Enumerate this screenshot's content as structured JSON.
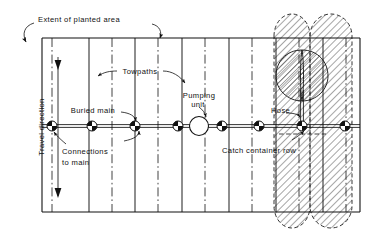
{
  "figure": {
    "type": "engineering-plan-diagram",
    "background_color": "#ffffff",
    "line_color": "#111111"
  },
  "labels": {
    "extent_of_planted_area": "Extent of planted area",
    "travel_direction": "Travel direction",
    "towpaths": "Towpaths",
    "buried_main": "Buried main",
    "connections_to_main_line1": "Connections",
    "connections_to_main_line2": "to main",
    "pumping_unit_line1": "Pumping",
    "pumping_unit_line2": "unit",
    "hose": "Hose",
    "catch_container_row": "Catch container row"
  },
  "field": {
    "left": 42,
    "right": 360,
    "top": 38,
    "bottom": 212,
    "border_color": "#111111",
    "border_width": 1.1
  },
  "towpaths": {
    "description": "solid vertical lines dividing the planted area",
    "x_positions": [
      89,
      135,
      182,
      229,
      276,
      323
    ],
    "style": "solid",
    "color": "#111111"
  },
  "crop_rows": {
    "description": "dash-dot vertical lines marking buried main connection rows",
    "x_positions": [
      52,
      112,
      158,
      205,
      252,
      299,
      346
    ],
    "style": "dash-dot",
    "color": "#111111"
  },
  "buried_main": {
    "description": "horizontal double line carrying water across the field",
    "y": 126,
    "x_start": 42,
    "x_end": 360,
    "style": "double-solid",
    "color": "#111111"
  },
  "connections": {
    "description": "quadrant-filled circle markers where risers connect to the buried main",
    "radius": 5.0,
    "y": 126,
    "x_positions": [
      52,
      92,
      135,
      178,
      222,
      259,
      302,
      345
    ],
    "fill_pattern": "alternating-quadrants"
  },
  "pumping_unit": {
    "description": "large open circle on the main line",
    "cx": 199,
    "cy": 126,
    "radius": 9.5,
    "fill": "#ffffff",
    "stroke": "#111111"
  },
  "hose": {
    "description": "vertical twin line running from the main up to the sprinkler position",
    "x": 302,
    "y_top": 92,
    "y_bottom": 126
  },
  "catch_container_row": {
    "description": "short dashed horizontal line below the main between two connections",
    "y": 134,
    "x_start": 281,
    "x_end": 324,
    "style": "dashed"
  },
  "wetted_patterns": {
    "description": "hatched regions showing the irrigated / wetted strips at the right hand end",
    "hatch_angle_deg": 45,
    "hatch_spacing": 5,
    "bands": [
      {
        "name": "left-band",
        "x_left": 274,
        "x_right": 310,
        "top": 14,
        "bottom": 228,
        "cap": "rounded"
      },
      {
        "name": "right-band",
        "x_left": 310,
        "x_right": 352,
        "top": 14,
        "bottom": 228,
        "cap": "rounded"
      }
    ],
    "lobe": {
      "name": "sprinkler-lobe",
      "cx": 302,
      "cy": 76,
      "rx": 26,
      "ry": 26
    }
  },
  "arrows": {
    "travel_direction": {
      "x": 58,
      "y_top": 58,
      "y_bottom": 198,
      "heads": "both"
    },
    "extent_left": {
      "from": [
        48,
        26
      ],
      "to": [
        44,
        40
      ]
    },
    "extent_right": {
      "from": [
        150,
        26
      ],
      "to": [
        137,
        40
      ]
    },
    "towpath_left": {
      "from": [
        111,
        70
      ],
      "to": [
        92,
        74
      ]
    },
    "towpath_right": {
      "from": [
        160,
        70
      ],
      "to": [
        180,
        82
      ]
    },
    "buried_main": {
      "from": [
        112,
        113
      ],
      "to": [
        135,
        124
      ]
    },
    "connections": {
      "from": [
        66,
        145
      ],
      "to": [
        53,
        132
      ]
    },
    "connections_right": {
      "from": [
        122,
        142
      ],
      "to": [
        136,
        132
      ]
    },
    "pumping_unit": {
      "from": [
        199,
        108
      ],
      "to": [
        206,
        118
      ]
    },
    "hose": {
      "from": [
        289,
        113
      ],
      "to": [
        302,
        118
      ]
    },
    "catch_container": {
      "from": [
        296,
        139
      ],
      "to": [
        306,
        130
      ]
    }
  }
}
